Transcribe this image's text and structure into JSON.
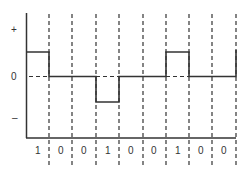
{
  "diagram": {
    "type": "line-coding-waveform",
    "y_axis_labels": {
      "plus": "+",
      "zero": "0",
      "minus": "–"
    },
    "bits": [
      "1",
      "0",
      "0",
      "1",
      "0",
      "0",
      "1",
      "0",
      "0"
    ],
    "levels": [
      1,
      0,
      0,
      -1,
      0,
      0,
      1,
      0,
      0
    ],
    "colors": {
      "line": "#333333",
      "background": "#ffffff"
    }
  }
}
